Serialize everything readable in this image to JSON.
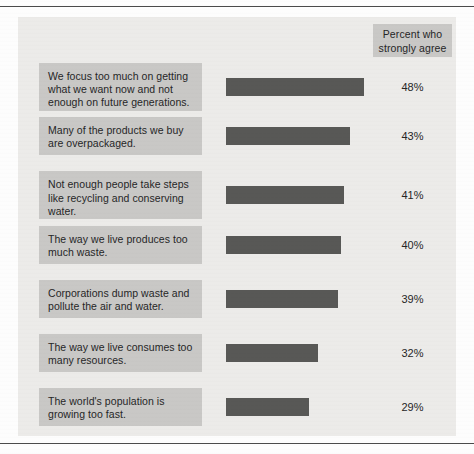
{
  "chart_data": {
    "type": "bar",
    "title": "",
    "orientation": "horizontal",
    "column_header": {
      "line1": "Percent who",
      "line2": "strongly agree"
    },
    "xlabel": "",
    "ylabel": "",
    "xlim": [
      0,
      50
    ],
    "grid": false,
    "legend": "none",
    "value_suffix": "%",
    "categories": [
      "We focus too much on getting what we want now and not enough on future generations.",
      "Many of the products we buy are overpackaged.",
      "Not enough people take steps like recycling and conserving water.",
      "The way we live produces too much waste.",
      "Corporations dump waste and pollute the air and water.",
      "The way we live consumes too many resources.",
      "The world's population is growing too fast."
    ],
    "values": [
      48,
      43,
      41,
      40,
      39,
      32,
      29
    ],
    "value_labels": [
      "48%",
      "43%",
      "41%",
      "40%",
      "39%",
      "32%",
      "29%"
    ],
    "colors": {
      "bar": "#585856",
      "label_box": "#c9c8c6",
      "panel": "#ecebe9",
      "text": "#262626",
      "rule": "#4a4a4a"
    }
  },
  "rows": [
    {
      "label": "We focus too much on getting what we want now and not enough on future generations.",
      "value": 48,
      "value_label": "48%"
    },
    {
      "label": "Many of the products we buy are overpackaged.",
      "value": 43,
      "value_label": "43%"
    },
    {
      "label": "Not enough people take steps like recycling and conserving water.",
      "value": 41,
      "value_label": "41%"
    },
    {
      "label": "The way we live produces too much waste.",
      "value": 40,
      "value_label": "40%"
    },
    {
      "label": "Corporations dump waste and pollute the air and water.",
      "value": 39,
      "value_label": "39%"
    },
    {
      "label": "The way we live consumes too many resources.",
      "value": 32,
      "value_label": "32%"
    },
    {
      "label": "The world's population is growing too fast.",
      "value": 29,
      "value_label": "29%"
    }
  ]
}
